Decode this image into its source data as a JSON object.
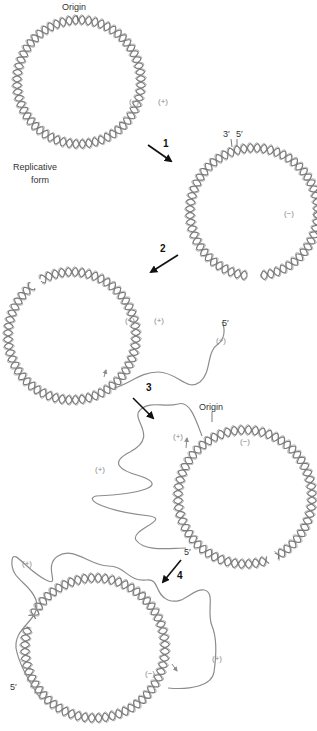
{
  "figure": {
    "colors": {
      "helix": "#7a7a7a",
      "strand": "#8c8c8c",
      "arrow": "#111111",
      "label": "#333333",
      "strand_label": "#8a8a8a"
    }
  },
  "circles": [
    {
      "id": "replicative-form",
      "cx": 79,
      "cy": 82,
      "r": 62,
      "turns": 30
    },
    {
      "id": "step1-nicked",
      "cx": 254,
      "cy": 212,
      "r": 64,
      "turns": 30,
      "gap_deg": [
        -96,
        -84
      ]
    },
    {
      "id": "step2-elongating",
      "cx": 72,
      "cy": 336,
      "r": 64,
      "turns": 30,
      "gap_deg": [
        52,
        60
      ]
    },
    {
      "id": "step3-rolling",
      "cx": 245,
      "cy": 497,
      "r": 67,
      "turns": 30,
      "gap_deg": [
        -118,
        -110
      ]
    },
    {
      "id": "step4-second-round",
      "cx": 95,
      "cy": 648,
      "r": 70,
      "turns": 32,
      "gap_deg": [
        18,
        26
      ]
    }
  ],
  "strands": [
    {
      "id": "plus-strand-step2",
      "d": "M 114 388 C 130 384 140 372 158 372 C 178 372 186 392 200 382 C 212 372 206 352 218 344 C 224 340 226 330 222 322"
    },
    {
      "id": "plus-strand-step3",
      "d": "M 202 436 C 196 420 190 400 178 404 C 164 408 150 400 140 410 C 130 420 160 436 130 452 C 110 462 118 470 140 476 C 170 486 140 494 96 496 C 82 500 110 512 150 516 C 170 520 130 530 136 540 C 144 552 170 548 186 548"
    },
    {
      "id": "plus-strand-step4",
      "d": "M 40 698 C 28 680 18 660 16 648 C 14 626 42 620 36 600 C 30 582 10 580 12 560 C 14 548 26 570 46 580 C 62 588 42 566 58 556 C 74 546 90 566 108 566 C 126 566 128 582 146 580 C 160 578 154 594 168 600 C 184 606 192 588 204 590 C 216 592 206 612 212 626 C 218 640 216 658 214 672 C 212 686 190 690 168 688"
    }
  ],
  "markers": [
    {
      "id": "origin-tick-1",
      "x1": 77,
      "y1": 15,
      "x2": 78,
      "y2": 21
    },
    {
      "id": "three-prime-tick",
      "x1": 231,
      "y1": 139,
      "x2": 232,
      "y2": 147
    },
    {
      "id": "five-prime-tick",
      "x1": 237,
      "y1": 139,
      "x2": 237,
      "y2": 146
    },
    {
      "id": "origin-tick-3",
      "x1": 212,
      "y1": 412,
      "x2": 212,
      "y2": 422
    }
  ],
  "growth_arrows": [
    {
      "id": "growth-arrow-step2",
      "x1": 104,
      "y1": 377,
      "x2": 106,
      "y2": 370
    },
    {
      "id": "growth-arrow-step3",
      "x1": 186,
      "y1": 448,
      "x2": 187,
      "y2": 438
    },
    {
      "id": "growth-arrow-step4",
      "x1": 172,
      "y1": 664,
      "x2": 177,
      "y2": 671
    }
  ],
  "steps": [
    {
      "number": "1",
      "x1": 148,
      "y1": 145,
      "x2": 171,
      "y2": 161,
      "label_x": 163,
      "label_y": 139
    },
    {
      "number": "2",
      "x1": 178,
      "y1": 255,
      "x2": 151,
      "y2": 272,
      "label_x": 160,
      "label_y": 244
    },
    {
      "number": "3",
      "x1": 133,
      "y1": 398,
      "x2": 153,
      "y2": 418,
      "label_x": 146,
      "label_y": 383
    },
    {
      "number": "4",
      "x1": 181,
      "y1": 560,
      "x2": 163,
      "y2": 582,
      "label_x": 177,
      "label_y": 571
    }
  ],
  "labels": [
    {
      "id": "origin-label-1",
      "text": "Origin",
      "x": 62,
      "y": 3,
      "kind": "text"
    },
    {
      "id": "minus-label-1",
      "text": "(−)",
      "x": 129,
      "y": 98,
      "kind": "strand"
    },
    {
      "id": "plus-label-1",
      "text": "(+)",
      "x": 158,
      "y": 98,
      "kind": "strand"
    },
    {
      "id": "replicative-form-label-1",
      "text": "Replicative",
      "x": 13,
      "y": 163,
      "kind": "text"
    },
    {
      "id": "replicative-form-label-2",
      "text": "form",
      "x": 31,
      "y": 176,
      "kind": "text"
    },
    {
      "id": "three-prime-label",
      "text": "3′",
      "x": 223,
      "y": 130,
      "kind": "text"
    },
    {
      "id": "five-prime-label",
      "text": "5′",
      "x": 236,
      "y": 130,
      "kind": "text"
    },
    {
      "id": "minus-label-2",
      "text": "(−)",
      "x": 284,
      "y": 210,
      "kind": "strand"
    },
    {
      "id": "plus-label-2-partial",
      "text": "(",
      "x": 313,
      "y": 210,
      "kind": "strand"
    },
    {
      "id": "minus-label-3",
      "text": "(−)",
      "x": 125,
      "y": 317,
      "kind": "strand"
    },
    {
      "id": "plus-label-3",
      "text": "(+)",
      "x": 154,
      "y": 317,
      "kind": "strand"
    },
    {
      "id": "five-prime-label-3",
      "text": "5′",
      "x": 222,
      "y": 319,
      "kind": "text"
    },
    {
      "id": "plus-label-3-strand",
      "text": "(+)",
      "x": 216,
      "y": 337,
      "kind": "strand"
    },
    {
      "id": "origin-label-3",
      "text": "Origin",
      "x": 199,
      "y": 403,
      "kind": "text"
    },
    {
      "id": "plus-label-4-inner",
      "text": "(+)",
      "x": 173,
      "y": 433,
      "kind": "strand"
    },
    {
      "id": "minus-label-4",
      "text": "(−)",
      "x": 240,
      "y": 438,
      "kind": "strand"
    },
    {
      "id": "plus-label-4-strand",
      "text": "(+)",
      "x": 95,
      "y": 466,
      "kind": "strand"
    },
    {
      "id": "five-prime-label-4",
      "text": "5′",
      "x": 184,
      "y": 548,
      "kind": "text"
    },
    {
      "id": "plus-label-5-top",
      "text": "(+)",
      "x": 22,
      "y": 560,
      "kind": "strand"
    },
    {
      "id": "plus-label-5-right",
      "text": "(+)",
      "x": 212,
      "y": 655,
      "kind": "strand"
    },
    {
      "id": "minus-label-5",
      "text": "(−)",
      "x": 145,
      "y": 670,
      "kind": "strand"
    },
    {
      "id": "five-prime-label-5",
      "text": "5′",
      "x": 10,
      "y": 683,
      "kind": "text"
    }
  ]
}
